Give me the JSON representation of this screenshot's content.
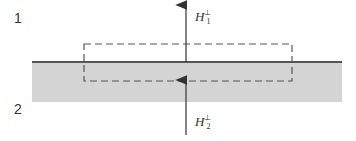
{
  "diagram": {
    "regions": [
      {
        "id": "region-1",
        "label": "1",
        "description": "upper medium (white)"
      },
      {
        "id": "region-2",
        "label": "2",
        "description": "lower medium (gray)"
      }
    ],
    "fields": [
      {
        "id": "h1",
        "symbol": "H",
        "superscript": "⊥",
        "subscript": "1",
        "direction": "up"
      },
      {
        "id": "h2",
        "symbol": "H",
        "superscript": "⊥",
        "subscript": "2",
        "direction": "up"
      }
    ],
    "colors": {
      "boundary": "#555555",
      "medium2_fill": "#d4d4d4",
      "dashed_box": "#555555",
      "arrow": "#333333",
      "text": "#333333"
    }
  }
}
